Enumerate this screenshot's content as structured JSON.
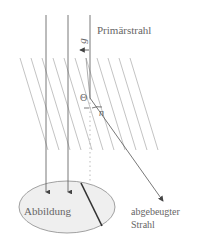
{
  "labels": {
    "primary_beam": "Primärstrahl",
    "image": "Abbildung",
    "diffracted_beam_line1": "abgebeugter",
    "diffracted_beam_line2": "Strahl",
    "g_vector": "g",
    "theta": "Θ",
    "n_vector": "n"
  },
  "colors": {
    "line": "#555555",
    "lattice": "#9a9a9a",
    "ellipse_fill": "#eeeeee",
    "ellipse_stroke": "#888888",
    "text": "#666666"
  }
}
